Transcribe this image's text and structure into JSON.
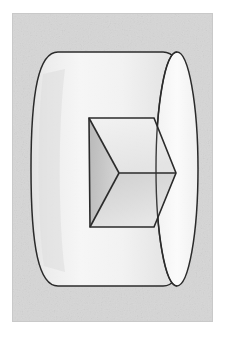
{
  "page": {
    "background_color": "#ffffff",
    "width": 226,
    "height": 337,
    "caption": ""
  },
  "figure": {
    "name": "impossible-cylinder-illusion",
    "title": "",
    "type": "line-drawing-illustration",
    "medium": "scanned pencil and ink drawing",
    "frame": {
      "x": 12,
      "y": 13,
      "width": 201,
      "height": 309,
      "fill_color": "#dadada",
      "border_color": "#c9c9c9",
      "border_width": 1
    },
    "colors": {
      "paper": "#ffffff",
      "frame_fill": "#dadada",
      "cylinder_body": "#f1f1f1",
      "cylinder_end_face": "#fafafa",
      "inner_face_left_dark": "#c4c4c4",
      "inner_face_bottom_mid": "#d2d2d2",
      "inner_face_top_light": "#ececec",
      "ink_line": "#2b2b2b"
    },
    "shapes": [
      {
        "name": "cylinder-body",
        "label": "Cylinder barrel",
        "fill": "#f1f1f1"
      },
      {
        "name": "cylinder-right-end-face",
        "label": "Right circular end face",
        "fill": "#fafafa"
      },
      {
        "name": "inner-cube-top-face",
        "label": "Upper inner facet",
        "fill": "#ececec"
      },
      {
        "name": "inner-cube-left-face",
        "label": "Left inner facet (shaded)",
        "fill": "#c4c4c4"
      },
      {
        "name": "inner-cube-bottom-face",
        "label": "Lower inner facet",
        "fill": "#d9d9d9"
      }
    ],
    "geometry": {
      "cylinder": {
        "left_edge_x": 18,
        "right_edge_x": 184,
        "top_y": 38,
        "bottom_y": 272,
        "end_ellipse_center_x": 164,
        "end_ellipse_rx": 21,
        "end_ellipse_ry": 117
      },
      "inner_hexagon_vertices": [
        {
          "name": "top-left",
          "x": 76,
          "y": 104
        },
        {
          "name": "top-right",
          "x": 141,
          "y": 104
        },
        {
          "name": "chevron-tip-right",
          "x": 163,
          "y": 159
        },
        {
          "name": "bottom-right",
          "x": 141,
          "y": 213
        },
        {
          "name": "bottom-left",
          "x": 77,
          "y": 213
        },
        {
          "name": "center-vertex",
          "x": 106,
          "y": 159
        }
      ]
    }
  }
}
